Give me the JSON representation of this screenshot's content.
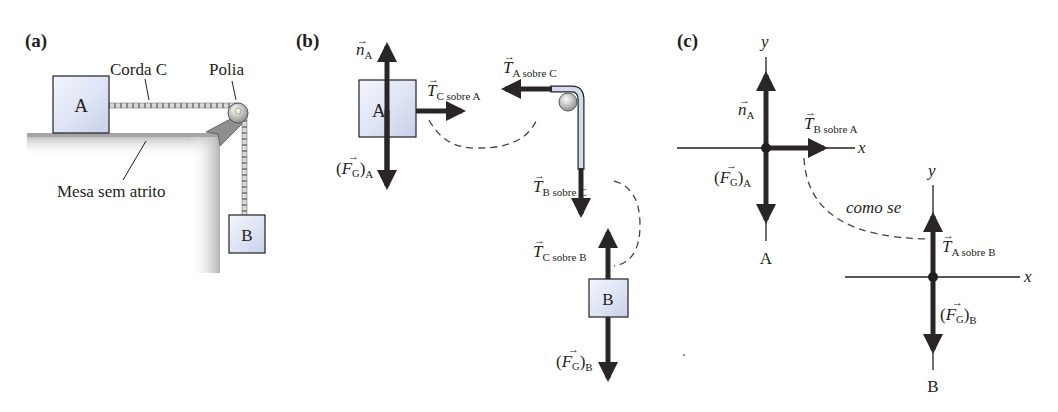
{
  "figure": {
    "panels": {
      "a": {
        "label": "(a)",
        "block_a": "A",
        "block_b": "B",
        "rope_label": "Corda C",
        "pulley_label": "Polia",
        "table_label": "Mesa sem atrito"
      },
      "b": {
        "label": "(b)",
        "block_a": "A",
        "block_b": "B",
        "n_A": {
          "sym": "n",
          "sub": "A"
        },
        "Fg_A": {
          "open": "(",
          "sym": "F",
          "symsub": "G",
          "close": ")",
          "sub": "A"
        },
        "T_C_on_A": {
          "sym": "T",
          "sub": "C sobre A"
        },
        "T_A_on_C": {
          "sym": "T",
          "sub": "A sobre C"
        },
        "T_B_on_C": {
          "sym": "T",
          "sub": "B sobre C"
        },
        "T_C_on_B": {
          "sym": "T",
          "sub": "C sobre B"
        },
        "Fg_B": {
          "open": "(",
          "sym": "F",
          "symsub": "G",
          "close": ")",
          "sub": "B"
        }
      },
      "c": {
        "label": "(c)",
        "axis_x": "x",
        "axis_y": "y",
        "body_a": "A",
        "body_b": "B",
        "n_A": {
          "sym": "n",
          "sub": "A"
        },
        "T_B_on_A": {
          "sym": "T",
          "sub": "B sobre A"
        },
        "Fg_A": {
          "open": "(",
          "sym": "F",
          "symsub": "G",
          "close": ")",
          "sub": "A"
        },
        "T_A_on_B": {
          "sym": "T",
          "sub": "A sobre B"
        },
        "Fg_B": {
          "open": "(",
          "sym": "F",
          "symsub": "G",
          "close": ")",
          "sub": "B"
        },
        "pair_note": "como se"
      }
    },
    "colors": {
      "ink": "#231f20",
      "arrow": "#2b2626",
      "block_fill_light": "#eef1fb",
      "block_fill_dark": "#c9d2ea",
      "table_shade": "#b8b8b8"
    }
  }
}
